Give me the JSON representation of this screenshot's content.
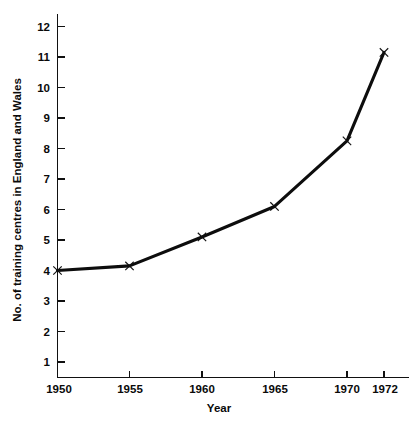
{
  "chart_data": {
    "type": "line",
    "title": "",
    "subtitle": "",
    "xlabel": "Year",
    "ylabel": "No. of training centres in England and Wales",
    "x": [
      1950,
      1955,
      1960,
      1965,
      1970,
      1972
    ],
    "values": [
      4.0,
      4.15,
      5.1,
      6.1,
      8.25,
      11.15
    ],
    "series": [
      {
        "name": "No. of training centres",
        "values": [
          4.0,
          4.15,
          5.1,
          6.1,
          8.25,
          11.15
        ]
      }
    ],
    "xtick_labels": [
      "1950",
      "1955",
      "1960",
      "1965",
      "1970",
      "1972"
    ],
    "ytick_labels": [
      "1",
      "2",
      "3",
      "4",
      "5",
      "6",
      "7",
      "8",
      "9",
      "10",
      "11",
      "12"
    ],
    "yticks": [
      1,
      2,
      3,
      4,
      5,
      6,
      7,
      8,
      9,
      10,
      11,
      12
    ],
    "xlim": [
      1950,
      1973
    ],
    "ylim": [
      0,
      12.4
    ],
    "grid": false,
    "legend": false,
    "legend_position": "none",
    "marker": "x",
    "line_color": "#0d0d0d",
    "marker_color": "#111111",
    "background_color": "#ffffff",
    "annotations": []
  }
}
